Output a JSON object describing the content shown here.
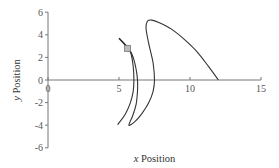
{
  "chart_data": {
    "type": "line",
    "title": "",
    "xlabel": "x Position",
    "ylabel": "y Position",
    "xlim": [
      0,
      15
    ],
    "ylim": [
      -6,
      6
    ],
    "xticks": [
      0,
      5,
      10,
      15
    ],
    "yticks": [
      -6,
      -4,
      -2,
      0,
      2,
      4,
      6
    ],
    "grid": false,
    "legend": null,
    "series": [
      {
        "name": "trajectory",
        "color": "#333333",
        "points": [
          [
            12.0,
            0.0
          ],
          [
            11.3,
            1.2
          ],
          [
            10.5,
            2.5
          ],
          [
            9.6,
            3.6
          ],
          [
            8.7,
            4.5
          ],
          [
            7.8,
            5.1
          ],
          [
            7.3,
            5.3
          ],
          [
            7.0,
            5.2
          ],
          [
            6.9,
            4.6
          ],
          [
            7.1,
            3.2
          ],
          [
            7.4,
            1.5
          ],
          [
            7.5,
            0.0
          ],
          [
            7.4,
            -1.0
          ],
          [
            7.1,
            -2.0
          ],
          [
            6.6,
            -3.0
          ],
          [
            6.1,
            -3.7
          ],
          [
            5.7,
            -4.0
          ],
          [
            5.95,
            -3.2
          ],
          [
            6.2,
            -2.2
          ],
          [
            6.3,
            -1.0
          ],
          [
            6.3,
            0.0
          ],
          [
            6.2,
            1.0
          ],
          [
            6.0,
            2.0
          ],
          [
            5.7,
            2.8
          ],
          [
            5.6,
            2.9
          ],
          [
            5.85,
            2.3
          ],
          [
            6.0,
            1.2
          ],
          [
            6.05,
            0.0
          ],
          [
            6.0,
            -1.0
          ],
          [
            5.8,
            -2.0
          ],
          [
            5.45,
            -3.0
          ],
          [
            5.0,
            -3.8
          ],
          [
            4.9,
            -3.95
          ]
        ],
        "marker": {
          "x": 5.6,
          "y": 2.8,
          "shape": "square",
          "color": "#bbbbbb"
        },
        "arrow": {
          "from": [
            5.6,
            2.9
          ],
          "to": [
            5.0,
            3.7
          ]
        }
      }
    ]
  }
}
